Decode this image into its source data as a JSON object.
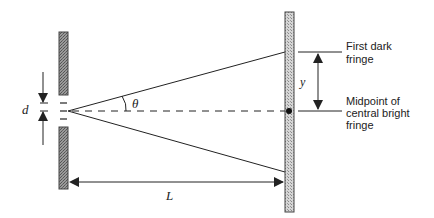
{
  "diagram": {
    "type": "double-slit-interference",
    "labels": {
      "slit_separation": "d",
      "angle": "θ",
      "distance_to_screen": "L",
      "fringe_offset": "y",
      "first_dark_fringe_line1": "First dark",
      "first_dark_fringe_line2": "fringe",
      "central_bright_line1": "Midpoint of",
      "central_bright_line2": "central bright",
      "central_bright_line3": "fringe"
    },
    "colors": {
      "line": "#222222",
      "barrier_fill": "#8a8a8a",
      "screen_fill": "#c8c8c8"
    }
  }
}
